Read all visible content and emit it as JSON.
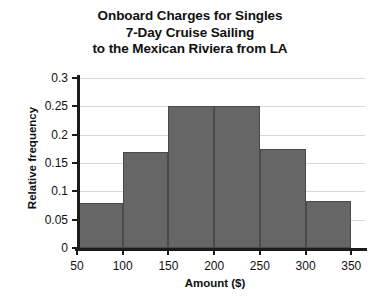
{
  "chart_data": {
    "type": "bar",
    "title": "Onboard Charges for Singles 7-Day Cruise Sailing to the Mexican Riviera from LA",
    "title_lines": [
      "Onboard Charges for Singles",
      "7-Day Cruise Sailing",
      "to the Mexican Riviera from LA"
    ],
    "xlabel": "Amount ($)",
    "ylabel": "Relative frequency",
    "xlim": [
      50,
      365
    ],
    "ylim": [
      0,
      0.3
    ],
    "grid": true,
    "legend": false,
    "bar_color": "#666666",
    "bar_edge_color": "#4a4a4a",
    "grid_color": "#d7d7d7",
    "axis_color": "#1b1b1b",
    "bin_width": 50,
    "bin_edges": [
      50,
      100,
      150,
      200,
      250,
      300,
      350
    ],
    "categories": [
      "50-100",
      "100-150",
      "150-200",
      "200-250",
      "250-300",
      "300-350"
    ],
    "values": [
      0.08,
      0.17,
      0.25,
      0.25,
      0.175,
      0.083
    ],
    "xticks": [
      50,
      100,
      150,
      200,
      250,
      300,
      350
    ],
    "xtick_labels": [
      "50",
      "100",
      "150",
      "200",
      "250",
      "300",
      "350"
    ],
    "yticks": [
      0,
      0.05,
      0.1,
      0.15,
      0.2,
      0.25,
      0.3
    ],
    "ytick_labels": [
      "0",
      "0.05",
      "0.1",
      "0.15",
      "0.2",
      "0.25",
      "0.3"
    ]
  }
}
